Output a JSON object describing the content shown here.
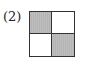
{
  "label": "(2)",
  "grid": {
    "rows": 2,
    "cols": 2,
    "cells": [
      {
        "position": "top-left",
        "shaded": true
      },
      {
        "position": "top-right",
        "shaded": false
      },
      {
        "position": "bottom-left",
        "shaded": false
      },
      {
        "position": "bottom-right",
        "shaded": true
      }
    ],
    "shade_color": "#b4b4b4",
    "line_color": "#333333"
  }
}
